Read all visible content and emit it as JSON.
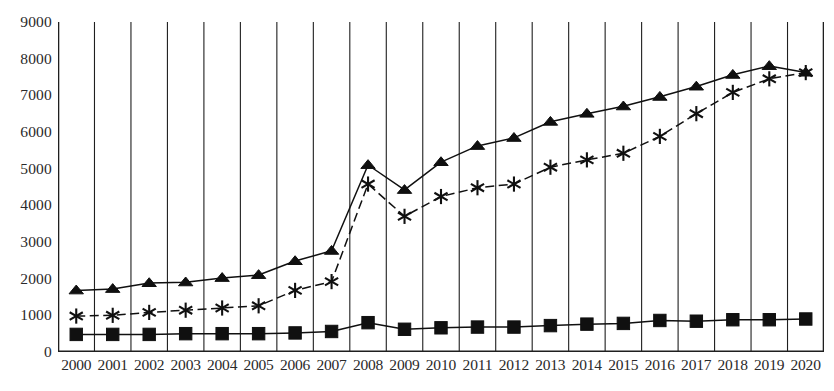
{
  "chart_data": {
    "type": "line",
    "title": "",
    "subtitle": "",
    "xlabel": "",
    "ylabel": "",
    "grid": "vertical-only",
    "legend": "none",
    "categories": [
      "2000",
      "2001",
      "2002",
      "2003",
      "2004",
      "2005",
      "2006",
      "2007",
      "2008",
      "2009",
      "2010",
      "2011",
      "2012",
      "2013",
      "2014",
      "2015",
      "2016",
      "2017",
      "2018",
      "2019",
      "2020"
    ],
    "xlim": [
      2000,
      2020
    ],
    "ylim": [
      0,
      9000
    ],
    "yticks": [
      0,
      1000,
      2000,
      3000,
      4000,
      5000,
      6000,
      7000,
      8000,
      9000
    ],
    "ytick_labels": [
      "0",
      "1000",
      "2000",
      "3000",
      "4000",
      "5000",
      "6000",
      "7000",
      "8000",
      "9000"
    ],
    "series": [
      {
        "name": "series-triangle",
        "marker": "triangle",
        "line_style": "solid",
        "color": "#101010",
        "values": [
          1680,
          1720,
          1880,
          1900,
          2020,
          2100,
          2480,
          2760,
          5100,
          4420,
          5180,
          5620,
          5840,
          6280,
          6500,
          6700,
          6960,
          7240,
          7560,
          7800,
          7620
        ]
      },
      {
        "name": "series-star",
        "marker": "asterisk",
        "line_style": "dashed",
        "color": "#101010",
        "values": [
          980,
          1000,
          1080,
          1140,
          1200,
          1260,
          1680,
          1920,
          4580,
          3700,
          4240,
          4480,
          4580,
          5040,
          5240,
          5420,
          5880,
          6500,
          7080,
          7450,
          7620
        ]
      },
      {
        "name": "series-square",
        "marker": "square",
        "line_style": "solid",
        "color": "#101010",
        "values": [
          480,
          480,
          480,
          500,
          500,
          500,
          520,
          560,
          800,
          620,
          660,
          680,
          680,
          720,
          760,
          780,
          860,
          840,
          880,
          880,
          900
        ]
      }
    ]
  },
  "axes": {
    "y_tick_labels": [
      "9000",
      "8000",
      "7000",
      "6000",
      "5000",
      "4000",
      "3000",
      "2000",
      "1000",
      "0"
    ],
    "x_tick_labels": [
      "2000",
      "2001",
      "2002",
      "2003",
      "2004",
      "2005",
      "2006",
      "2007",
      "2008",
      "2009",
      "2010",
      "2011",
      "2012",
      "2013",
      "2014",
      "2015",
      "2016",
      "2017",
      "2018",
      "2019",
      "2020"
    ]
  },
  "colors": {
    "ink": "#101010",
    "grid": "#1f1f1f",
    "text": "#2a2a2a",
    "background": "#ffffff"
  }
}
